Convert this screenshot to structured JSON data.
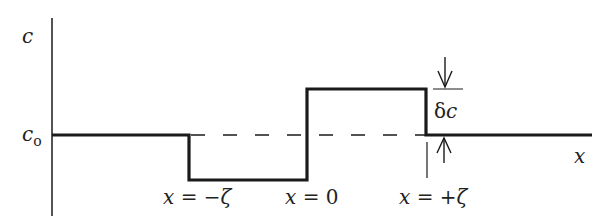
{
  "diagram": {
    "type": "step-profile",
    "colors": {
      "line": "#1a1a1a",
      "text": "#222222",
      "background": "#ffffff"
    },
    "axes": {
      "y_label": "c",
      "x_label": "x",
      "y_reference_label_main": "c",
      "y_reference_label_sub": "o"
    },
    "profile": {
      "description": "Concentration profile: baseline c0, drops by δc on −ζ<x<0, rises by δc on 0<x<+ζ, returns to c0 for x>+ζ",
      "segments": [
        {
          "from": "axis",
          "to": "x = −ζ",
          "level": "c0"
        },
        {
          "from": "x = −ζ",
          "to": "x = 0",
          "level": "c0 − δc"
        },
        {
          "from": "x = 0",
          "to": "x = +ζ",
          "level": "c0 + δc"
        },
        {
          "from": "x = +ζ",
          "to": "end",
          "level": "c0"
        }
      ]
    },
    "annotations": {
      "delta_label_greek": "δ",
      "delta_label_var": "c"
    },
    "tick_labels": [
      {
        "var": "x",
        "eq": " = ",
        "val": "−ζ"
      },
      {
        "var": "x",
        "eq": " = ",
        "val": "0"
      },
      {
        "var": "x",
        "eq": " = ",
        "val": "+ζ"
      }
    ]
  }
}
